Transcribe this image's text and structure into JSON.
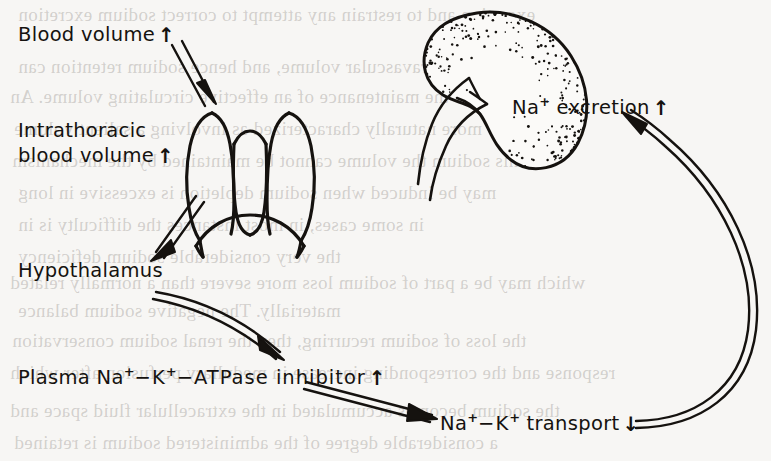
{
  "figure": {
    "background_color": "#f7f6f4",
    "ink_color": "#15120f"
  },
  "nodes": [
    {
      "id": "blood-volume",
      "label": "Blood volume",
      "trend": "↑",
      "trend_name": "increase",
      "x": 18,
      "y": 22
    },
    {
      "id": "intrathoracic-blood-volume",
      "label_line1": "Intrathoracic",
      "label_line2": "blood volume",
      "trend": "↑",
      "trend_name": "increase",
      "x": 18,
      "y": 118
    },
    {
      "id": "hypothalamus",
      "label": "Hypothalamus",
      "trend": "",
      "trend_name": "none",
      "x": 18,
      "y": 258
    },
    {
      "id": "plasma-atpase-inhibitor",
      "label_pre": "Plasma Na",
      "label_sup1": "+",
      "label_mid": "−K",
      "label_sup2": "+",
      "label_post": "−ATPase inhibitor",
      "trend": "↑",
      "trend_name": "increase",
      "x": 18,
      "y": 364
    },
    {
      "id": "na-k-transport",
      "label_pre": "Na",
      "label_sup1": "+",
      "label_mid": "−K",
      "label_sup2": "+",
      "label_post": " transport",
      "trend": "↓",
      "trend_name": "decrease",
      "x": 440,
      "y": 410
    },
    {
      "id": "na-excretion",
      "label_pre": "Na",
      "label_sup1": "+",
      "label_post": " excretion",
      "trend": "↑",
      "trend_name": "increase",
      "x": 512,
      "y": 94
    }
  ],
  "anatomy": [
    {
      "id": "thorax",
      "name": "thorax-lungs-heart-diaphragm",
      "description": "Outline drawing of the thorax showing both lungs, the central mediastinum/heart and the domed diaphragm"
    },
    {
      "id": "kidney",
      "name": "kidney-with-vessels",
      "description": "Stippled bean-shaped kidney with renal artery and renal vein emerging from the hilum"
    }
  ],
  "arrows": [
    {
      "id": "arrow-blood-to-thorax",
      "from": "blood-volume",
      "to": "thorax",
      "style": "double-line-straight"
    },
    {
      "id": "arrow-thorax-to-hypothalamus",
      "from": "thorax",
      "to": "hypothalamus",
      "style": "double-line-straight"
    },
    {
      "id": "arrow-hypothalamus-to-inhibitor",
      "from": "hypothalamus",
      "to": "plasma-atpase-inhibitor",
      "style": "double-line-curved"
    },
    {
      "id": "arrow-inhibitor-to-transport",
      "from": "plasma-atpase-inhibitor",
      "to": "na-k-transport",
      "style": "double-line-straight"
    },
    {
      "id": "arrow-transport-to-excretion",
      "from": "na-k-transport",
      "to": "na-excretion",
      "style": "double-line-long-curve"
    }
  ],
  "bleed_through": [
    {
      "text": "excretion and to restrain any attempt to correct sodium excretion",
      "x": 18,
      "y": 4
    },
    {
      "text": "volume or intravascular volume, and hence sodium retention can",
      "x": 18,
      "y": 56
    },
    {
      "text": "sodium for the maintenance of an effective circulating volume. An",
      "x": 10,
      "y": 86
    },
    {
      "text": "more naturally characterized as involving a salient volume",
      "x": 14,
      "y": 118
    },
    {
      "text": "this sodium the volume cannot be maintained by the mechanism",
      "x": 12,
      "y": 150
    },
    {
      "text": "may be induced when sodium depletion is excessive in long",
      "x": 18,
      "y": 182
    },
    {
      "text": "in some cases, in most instances the difficulty is in",
      "x": 18,
      "y": 214
    },
    {
      "text": "the very considerable sodium deficiency",
      "x": 18,
      "y": 246
    },
    {
      "text": "which may be a part of sodium loss more severe than a normally related",
      "x": 10,
      "y": 272
    },
    {
      "text": "materially. The negative sodium balance",
      "x": 18,
      "y": 300
    },
    {
      "text": "the loss of sodium recurring, then the renal sodium conservation",
      "x": 12,
      "y": 330
    },
    {
      "text": "response and the corresponding increase in medullary perfusion after which",
      "x": 10,
      "y": 362
    },
    {
      "text": "the sodium becomes accumulated in the extracellular fluid space and",
      "x": 10,
      "y": 400
    },
    {
      "text": "a considerable degree of the administered sodium is retained",
      "x": 14,
      "y": 432
    }
  ]
}
